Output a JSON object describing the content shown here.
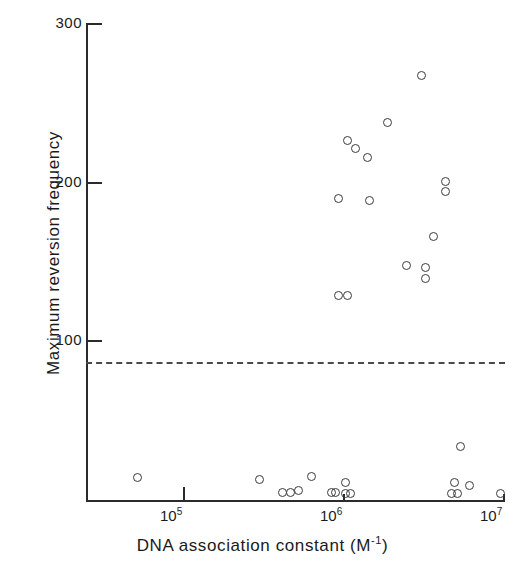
{
  "chart_data": {
    "type": "scatter",
    "title": "",
    "xlabel": "DNA association constant (M⁻¹)",
    "ylabel": "Maximum reversion frequency",
    "xscale": "log",
    "yscale": "linear",
    "xlim": [
      30000,
      11000000
    ],
    "ylim": [
      0,
      300
    ],
    "ytick_labels": [
      "100",
      "200",
      "300"
    ],
    "ytick_values": [
      100,
      200,
      300
    ],
    "xtick_labels": [
      "10⁵",
      "10⁶",
      "10⁷"
    ],
    "xtick_values": [
      100000,
      1000000,
      10000000
    ],
    "xtick_mantissa": "10",
    "xtick_exponents": [
      "5",
      "6",
      "7"
    ],
    "grid": false,
    "legend": null,
    "marker_style": "open-circle",
    "annotations": [
      {
        "type": "hline",
        "label": "threshold",
        "y": 86,
        "style": "dashed"
      }
    ],
    "points": [
      {
        "x": 3100000,
        "y": 267
      },
      {
        "x": 1900000,
        "y": 237
      },
      {
        "x": 1060000,
        "y": 226
      },
      {
        "x": 1200000,
        "y": 221
      },
      {
        "x": 1430000,
        "y": 215
      },
      {
        "x": 940000,
        "y": 189
      },
      {
        "x": 1470000,
        "y": 188
      },
      {
        "x": 4400000,
        "y": 200
      },
      {
        "x": 4400000,
        "y": 194
      },
      {
        "x": 3700000,
        "y": 165
      },
      {
        "x": 2500000,
        "y": 147
      },
      {
        "x": 3300000,
        "y": 146
      },
      {
        "x": 3300000,
        "y": 139
      },
      {
        "x": 940000,
        "y": 128
      },
      {
        "x": 1060000,
        "y": 128
      },
      {
        "x": 5400000,
        "y": 33
      },
      {
        "x": 52000,
        "y": 13
      },
      {
        "x": 300000,
        "y": 12
      },
      {
        "x": 640000,
        "y": 14
      },
      {
        "x": 420000,
        "y": 4
      },
      {
        "x": 470000,
        "y": 4
      },
      {
        "x": 530000,
        "y": 5
      },
      {
        "x": 850000,
        "y": 4
      },
      {
        "x": 900000,
        "y": 4
      },
      {
        "x": 1030000,
        "y": 10
      },
      {
        "x": 1030000,
        "y": 3
      },
      {
        "x": 1120000,
        "y": 3
      },
      {
        "x": 5000000,
        "y": 10
      },
      {
        "x": 4800000,
        "y": 3
      },
      {
        "x": 5200000,
        "y": 3
      },
      {
        "x": 6200000,
        "y": 8
      },
      {
        "x": 9600000,
        "y": 3
      }
    ]
  },
  "axes": {
    "y_title": "Maximum reversion frequency",
    "x_title_main": "DNA association constant (M",
    "x_title_sup": "-1",
    "x_title_close": ")"
  }
}
